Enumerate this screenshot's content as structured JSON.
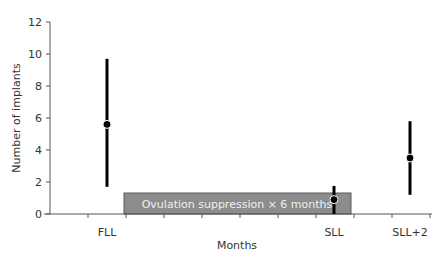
{
  "chart_data": {
    "type": "scatter",
    "subtype": "point-range",
    "title": "",
    "xlabel": "Months",
    "ylabel": "Number of implants",
    "ylim": [
      0,
      12
    ],
    "yticks": [
      0,
      2,
      4,
      6,
      8,
      10,
      12
    ],
    "grid": false,
    "categories": [
      "FLL",
      "SLL",
      "SLL+2"
    ],
    "series": [
      {
        "name": "Number of implants",
        "points": [
          {
            "label": "FLL",
            "value": 5.6,
            "low": 1.7,
            "high": 9.7
          },
          {
            "label": "SLL",
            "value": 0.9,
            "low": 0.0,
            "high": 1.75
          },
          {
            "label": "SLL+2",
            "value": 3.5,
            "low": 1.2,
            "high": 5.8
          }
        ]
      }
    ],
    "annotations": [
      {
        "type": "shaded-box",
        "text": "Ovulation suppression × 6 months",
        "x_start_tick": 2,
        "x_end_tick": 8,
        "y_range": [
          0,
          1.3
        ],
        "color": "#8c8c8c"
      }
    ],
    "colors": {
      "points": "#000000",
      "box_fill": "#8c8c8c",
      "box_border": "#5a5a5a",
      "axis": "#555555"
    }
  }
}
